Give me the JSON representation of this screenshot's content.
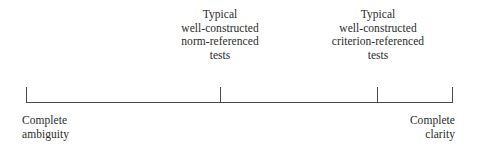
{
  "figure": {
    "type": "continuum-scale-diagram",
    "background_color": "#ffffff",
    "line_color": "#4a4a4a",
    "text_color": "#2b2b2b"
  },
  "axis": {
    "ticks": [
      {
        "label": "left-endpoint",
        "position_pct": 0
      },
      {
        "label": "norm-referenced-marker",
        "position_pct": 45.5
      },
      {
        "label": "criterion-referenced-marker",
        "position_pct": 82.4
      },
      {
        "label": "right-endpoint",
        "position_pct": 100
      }
    ]
  },
  "top_labels": [
    {
      "lines": [
        "Typical",
        "well-constructed",
        "norm-referenced",
        "tests"
      ],
      "line1": "Typical",
      "line2": "well-constructed",
      "line3": "norm-referenced",
      "line4": "tests"
    },
    {
      "lines": [
        "Typical",
        "well-constructed",
        "criterion-referenced",
        "tests"
      ],
      "line1": "Typical",
      "line2": "well-constructed",
      "line3": "criterion-referenced",
      "line4": "tests"
    }
  ],
  "end_labels": {
    "left": {
      "line1": "Complete",
      "line2": "ambiguity"
    },
    "right": {
      "line1": "Complete",
      "line2": "clarity"
    }
  },
  "chart_data": {
    "type": "line",
    "title": "",
    "subtitle": "",
    "xlabel": "",
    "ylabel": "",
    "grid": false,
    "legend": "none",
    "axis_orientation": "horizontal",
    "xlim": [
      0,
      100
    ],
    "categories": [
      "Complete ambiguity",
      "Typical well-constructed norm-referenced tests",
      "Typical well-constructed criterion-referenced tests",
      "Complete clarity"
    ],
    "values": [
      0,
      45.5,
      82.4,
      100
    ],
    "tick_labels": [
      "Complete ambiguity",
      "Typical well-constructed norm-referenced tests",
      "Typical well-constructed criterion-referenced tests",
      "Complete clarity"
    ],
    "annotations": [
      "Typical well-constructed norm-referenced tests",
      "Typical well-constructed criterion-referenced tests"
    ]
  }
}
